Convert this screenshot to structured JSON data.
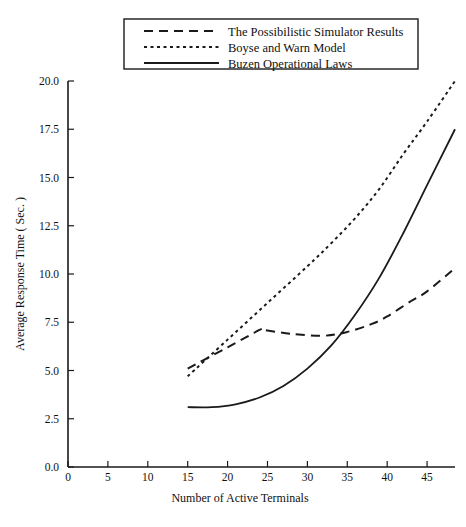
{
  "chart_data": {
    "type": "line",
    "title": "",
    "xlabel": "Number of Active Terminals",
    "ylabel": "Average Response Time ( Sec. )",
    "xlim": [
      0,
      48.5
    ],
    "ylim": [
      0.0,
      20.0
    ],
    "grid": false,
    "legend_position": "top-center",
    "xticks": [
      0,
      5,
      10,
      15,
      20,
      25,
      30,
      35,
      40,
      45
    ],
    "xtick_labels": [
      "0",
      "5",
      "10",
      "15",
      "20",
      "25",
      "30",
      "35",
      "40",
      "45"
    ],
    "yticks": [
      0.0,
      2.5,
      5.0,
      7.5,
      10.0,
      12.5,
      15.0,
      17.5,
      20.0
    ],
    "ytick_labels": [
      "0.0",
      "2.5",
      "5.0",
      "7.5",
      "10.0",
      "12.5",
      "15.0",
      "17.5",
      "20.0"
    ],
    "series": [
      {
        "name": "The Possibilistic Simulator Results",
        "style": "long-dash",
        "dasharray": "9,6",
        "x": [
          15,
          20,
          24,
          24.5,
          28,
          32,
          35,
          38,
          40,
          43,
          45,
          48.5
        ],
        "values": [
          5.1,
          6.2,
          7.1,
          7.1,
          6.9,
          6.8,
          7.0,
          7.4,
          7.8,
          8.6,
          9.1,
          10.3
        ]
      },
      {
        "name": "Boyse and Warn Model",
        "style": "short-dash",
        "dasharray": "3,3.5",
        "x": [
          15,
          20,
          25,
          30,
          33,
          36,
          39,
          42,
          45,
          48.5
        ],
        "values": [
          4.7,
          6.6,
          8.5,
          10.4,
          11.6,
          12.9,
          14.4,
          16.2,
          17.9,
          20.0
        ]
      },
      {
        "name": "Buzen Operational Laws",
        "style": "solid",
        "dasharray": "0",
        "x": [
          15,
          18,
          21,
          24,
          27,
          30,
          33,
          36,
          39,
          42,
          45,
          48.5
        ],
        "values": [
          3.1,
          3.1,
          3.25,
          3.6,
          4.2,
          5.1,
          6.3,
          7.9,
          9.8,
          12.1,
          14.6,
          17.5
        ]
      }
    ]
  },
  "legend": {
    "entries": [
      {
        "label": "The Possibilistic Simulator Results",
        "dasharray": "9,6"
      },
      {
        "label": "Boyse and Warn Model",
        "dasharray": "3,3.5"
      },
      {
        "label": "Buzen Operational Laws",
        "dasharray": "0"
      }
    ]
  }
}
